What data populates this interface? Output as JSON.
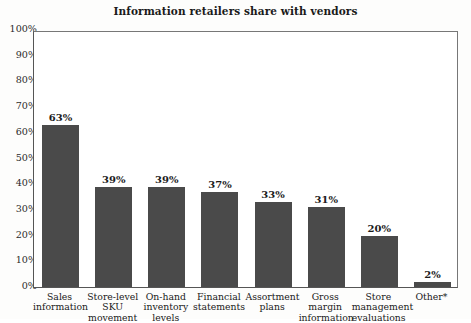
{
  "chart_data": {
    "type": "bar",
    "title": "Information retailers share with vendors",
    "xlabel": "",
    "ylabel": "",
    "ylim": [
      0,
      100
    ],
    "grid": false,
    "legend": "none",
    "y_tick_labels": [
      "100%",
      "90%",
      "80%",
      "70%",
      "60%",
      "50%",
      "40%",
      "30%",
      "20%",
      "10%",
      "0%"
    ],
    "y_tick_values": [
      100,
      90,
      80,
      70,
      60,
      50,
      40,
      30,
      20,
      10,
      0
    ],
    "categories": [
      "Sales information",
      "Store-level SKU movement",
      "On-hand inventory levels",
      "Financial statements",
      "Assortment plans",
      "Gross margin information",
      "Store management evaluations",
      "Other*"
    ],
    "category_lines": [
      [
        "Sales",
        "information"
      ],
      [
        "Store-level",
        "SKU",
        "movement"
      ],
      [
        "On-hand",
        "inventory",
        "levels"
      ],
      [
        "Financial",
        "statements"
      ],
      [
        "Assortment",
        "plans"
      ],
      [
        "Gross margin",
        "information"
      ],
      [
        "Store",
        "management",
        "evaluations"
      ],
      [
        "Other*"
      ]
    ],
    "values": [
      63,
      39,
      39,
      37,
      33,
      31,
      20,
      2
    ],
    "value_labels": [
      "63%",
      "39%",
      "39%",
      "37%",
      "33%",
      "31%",
      "20%",
      "2%"
    ],
    "bar_color": "#4a4a4a",
    "axis_color": "#555555",
    "background_color": "#ffffff",
    "text_color": "#1c1c1c"
  }
}
